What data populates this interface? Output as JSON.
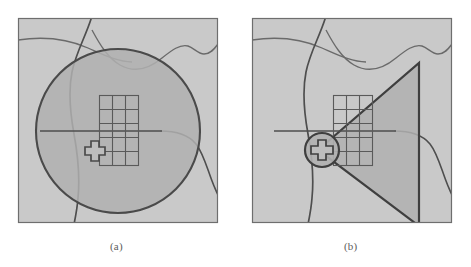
{
  "figure": {
    "title": "",
    "background_color": "#ffffff",
    "panels": [
      {
        "id": "a",
        "caption": "(a)",
        "map_fill": "#c9c9c9",
        "map_border": "#6e6e6e",
        "query_shape": "circle",
        "query_fill": "#b0b0b0",
        "query_stroke": "#4a4a4a",
        "grid_columns": 3,
        "grid_rows": 5,
        "grid_stroke": "#5a5a5a",
        "marker": "cross",
        "marker_stroke": "#4a4a4a",
        "marker_fill": "#bdbdbd"
      },
      {
        "id": "b",
        "caption": "(b)",
        "map_fill": "#c9c9c9",
        "map_border": "#6e6e6e",
        "query_shape": "triangle-wedge",
        "query_fill": "#b0b0b0",
        "query_stroke": "#3f3f3f",
        "grid_columns": 3,
        "grid_rows": 5,
        "grid_stroke": "#5a5a5a",
        "marker": "cross-in-circle",
        "marker_stroke": "#3f3f3f",
        "marker_fill": "#bdbdbd"
      }
    ],
    "colors": {
      "map_background": "#c9c9c9",
      "map_frame": "#6e6e6e",
      "feature_line": "#5f5f5f",
      "query_region": "#b0b0b0",
      "query_outline": "#3f3f3f",
      "grid_line": "#5a5a5a",
      "caption_text": "#5d5d5d",
      "page": "#ffffff"
    }
  }
}
